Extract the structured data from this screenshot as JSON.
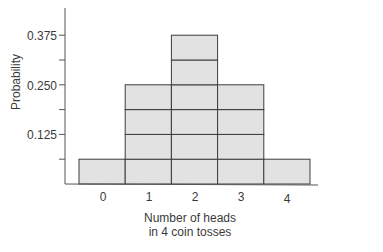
{
  "chart_data": {
    "type": "bar",
    "title": "",
    "xlabel": "Number of heads in 4 coin tosses",
    "xlabel_lines": [
      "Number of heads",
      "in 4 coin tosses"
    ],
    "ylabel": "Probability",
    "categories": [
      "0",
      "1",
      "2",
      "3",
      "4"
    ],
    "values": [
      0.0625,
      0.25,
      0.375,
      0.25,
      0.0625
    ],
    "stack_units": [
      1,
      4,
      6,
      4,
      1
    ],
    "unit": 0.0625,
    "yticks": [
      0.0625,
      0.125,
      0.1875,
      0.25,
      0.3125,
      0.375
    ],
    "ytick_labels": {
      "0.125": "0.125",
      "0.250": "0.250",
      "0.375": "0.375"
    },
    "ylim": [
      0,
      0.44
    ],
    "grid": false,
    "legend": null,
    "colors": {
      "bar_fill": "#e2e2e2",
      "bar_stroke": "#3c3c3c",
      "axis": "#555555"
    }
  },
  "axis": {
    "y_labels": [
      "0.375",
      "0.250",
      "0.125"
    ],
    "x_labels": [
      "0",
      "1",
      "2",
      "3",
      "4"
    ],
    "ylabel": "Probability",
    "xlabel_line1": "Number of heads",
    "xlabel_line2": "in 4 coin tosses"
  }
}
